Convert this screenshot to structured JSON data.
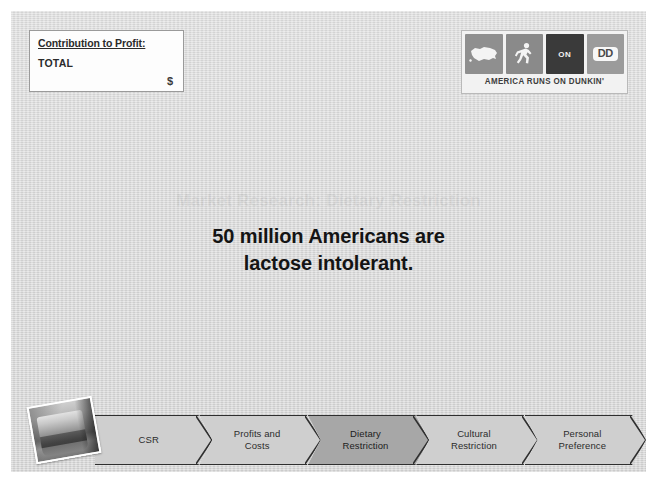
{
  "slide": {
    "background_color": "#d7d7d7",
    "border_color": "#ffffff"
  },
  "contribution_box": {
    "title": "Contribution to Profit:",
    "row_label": "TOTAL",
    "amount": "$"
  },
  "logo": {
    "tagline": "AMERICA RUNS ON DUNKIN'",
    "tiles": [
      {
        "name": "usa-map-icon",
        "label": ""
      },
      {
        "name": "runner-icon",
        "label": ""
      },
      {
        "name": "on-tile",
        "label": "ON"
      },
      {
        "name": "dd-tile",
        "label": "DD"
      }
    ],
    "tile_colors": [
      "#8f8f8f",
      "#8a8a8a",
      "#3a3a3a",
      "#9b9b9b"
    ]
  },
  "ghost_heading": {
    "text": "Market Research: Dietary Restriction"
  },
  "headline": {
    "line1": "50 million Americans are",
    "line2": "lactose intolerant.",
    "full": "50 million Americans are lactose intolerant."
  },
  "process_bar": {
    "active_index": 2,
    "active_color": "#a7a7a7",
    "inactive_color": "#cfcfcf",
    "steps": [
      {
        "line1": "CSR",
        "line2": ""
      },
      {
        "line1": "Profits and",
        "line2": "Costs"
      },
      {
        "line1": "Dietary",
        "line2": "Restriction"
      },
      {
        "line1": "Cultural",
        "line2": "Restriction"
      },
      {
        "line1": "Personal",
        "line2": "Preference"
      }
    ]
  },
  "cup_photo": {
    "caption": "coffee-cup-photo"
  }
}
